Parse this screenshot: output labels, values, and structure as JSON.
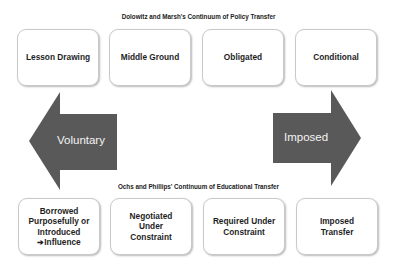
{
  "top_title": "Dolowitz and Marsh's Continuum of Policy Transfer",
  "top_boxes": [
    "Lesson Drawing",
    "Middle Ground",
    "Obligated",
    "Conditional"
  ],
  "arrows": {
    "left_label": "Voluntary",
    "right_label": "Imposed",
    "color": "#595959"
  },
  "bottom_title": "Ochs and Phillips' Continuum of Educational Transfer",
  "bottom_boxes": [
    {
      "lines": [
        "Borrowed",
        "Purposefully or",
        "Introduced"
      ],
      "arrow_glyph": "➔",
      "last": "Influence"
    },
    {
      "lines": [
        "Negotiated",
        "Under",
        "Constraint"
      ]
    },
    {
      "lines": [
        "Required Under",
        "Constraint"
      ]
    },
    {
      "lines": [
        "Imposed",
        "Transfer"
      ]
    }
  ]
}
